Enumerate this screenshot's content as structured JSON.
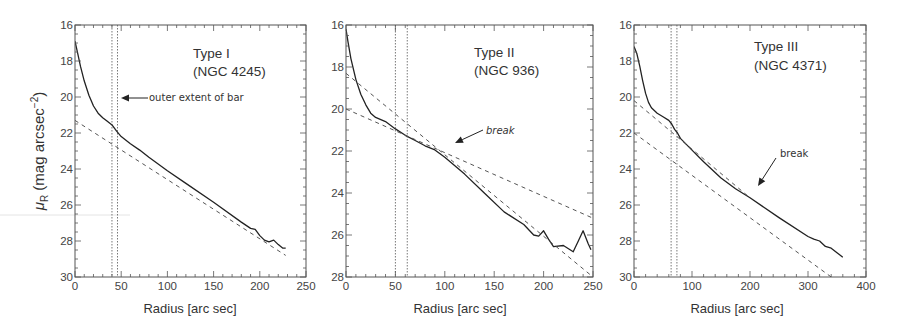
{
  "chart_data": [
    {
      "type": "line",
      "title": "Type I",
      "subtitle": "(NGC 4245)",
      "xlabel": "Radius [arc sec]",
      "ylabel": "μR (mag arcsec⁻²)",
      "xlim": [
        0,
        250
      ],
      "ylim": [
        30,
        16
      ],
      "xticks": [
        0,
        50,
        100,
        150,
        200,
        250
      ],
      "yticks": [
        16,
        18,
        20,
        22,
        24,
        26,
        28,
        30
      ],
      "bar_extent_lines": [
        40,
        46
      ],
      "annotations": [
        {
          "text": "outer extent of bar",
          "x": 46,
          "y": 20.1,
          "style": "normal"
        }
      ],
      "series": [
        {
          "name": "surface brightness profile",
          "style": "solid",
          "x": [
            0,
            3,
            6,
            10,
            15,
            20,
            25,
            30,
            35,
            40,
            45,
            50,
            60,
            70,
            80,
            100,
            120,
            150,
            180,
            190,
            195,
            200,
            205,
            210,
            215,
            220,
            225,
            228
          ],
          "y": [
            16.9,
            17.6,
            18.3,
            19.1,
            19.9,
            20.5,
            20.9,
            21.15,
            21.35,
            21.55,
            21.9,
            22.2,
            22.6,
            22.95,
            23.35,
            24.1,
            24.8,
            25.85,
            26.95,
            27.3,
            27.35,
            27.7,
            27.95,
            28.05,
            27.95,
            28.2,
            28.4,
            28.4
          ]
        },
        {
          "name": "exponential disk fit",
          "style": "dashed",
          "x": [
            0,
            228
          ],
          "y": [
            21.3,
            28.8
          ]
        }
      ]
    },
    {
      "type": "line",
      "title": "Type II",
      "subtitle": "(NGC 936)",
      "xlabel": "Radius [arc sec]",
      "ylabel": "",
      "xlim": [
        0,
        250
      ],
      "ylim": [
        28,
        16
      ],
      "xticks": [
        0,
        50,
        100,
        150,
        200,
        250
      ],
      "yticks": [
        16,
        18,
        20,
        22,
        24,
        26,
        28
      ],
      "bar_extent_lines": [
        50,
        62
      ],
      "annotations": [
        {
          "text": "break",
          "x": 100,
          "y": 22,
          "style": "italic"
        }
      ],
      "series": [
        {
          "name": "surface brightness profile",
          "style": "solid",
          "x": [
            0,
            2,
            5,
            10,
            15,
            20,
            25,
            30,
            40,
            50,
            60,
            70,
            80,
            90,
            100,
            120,
            140,
            160,
            180,
            190,
            195,
            200,
            205,
            210,
            220,
            230,
            235,
            240,
            245,
            248
          ],
          "y": [
            16.2,
            16.8,
            17.6,
            18.6,
            19.3,
            19.8,
            20.2,
            20.4,
            20.6,
            20.95,
            21.25,
            21.5,
            21.75,
            21.95,
            22.3,
            23.1,
            24.0,
            24.9,
            25.5,
            26.0,
            26.05,
            25.8,
            26.2,
            26.55,
            26.5,
            26.8,
            26.3,
            25.8,
            26.4,
            26.7
          ]
        },
        {
          "name": "inner disk fit",
          "style": "dashed",
          "x": [
            0,
            250
          ],
          "y": [
            20.0,
            25.2
          ]
        },
        {
          "name": "outer disk fit",
          "style": "dashed",
          "x": [
            0,
            250
          ],
          "y": [
            18.3,
            28.0
          ]
        }
      ]
    },
    {
      "type": "line",
      "title": "Type III",
      "subtitle": "(NGC 4371)",
      "xlabel": "Radius [arc sec]",
      "ylabel": "",
      "xlim": [
        0,
        400
      ],
      "ylim": [
        30,
        16
      ],
      "xticks": [
        0,
        100,
        200,
        300,
        400
      ],
      "yticks": [
        16,
        18,
        20,
        22,
        24,
        26,
        28,
        30
      ],
      "bar_extent_lines": [
        64,
        74
      ],
      "annotations": [
        {
          "text": "break",
          "x": 200,
          "y": 23.2,
          "style": "normal"
        }
      ],
      "series": [
        {
          "name": "surface brightness profile",
          "style": "solid",
          "x": [
            0,
            5,
            10,
            15,
            20,
            25,
            30,
            40,
            50,
            60,
            65,
            70,
            75,
            80,
            100,
            120,
            150,
            175,
            200,
            250,
            300,
            310,
            320,
            330,
            340,
            350,
            360
          ],
          "y": [
            17.2,
            17.6,
            18.3,
            19.1,
            19.8,
            20.3,
            20.6,
            20.9,
            21.1,
            21.3,
            21.5,
            21.8,
            22.0,
            22.3,
            22.95,
            23.6,
            24.5,
            25.1,
            25.6,
            26.7,
            27.75,
            27.9,
            28.0,
            28.3,
            28.4,
            28.65,
            28.9
          ]
        },
        {
          "name": "inner disk fit",
          "style": "dashed",
          "x": [
            0,
            200
          ],
          "y": [
            20.2,
            25.6
          ]
        },
        {
          "name": "outer disk fit",
          "style": "dashed",
          "x": [
            0,
            340
          ],
          "y": [
            22.0,
            30.0
          ]
        }
      ]
    }
  ],
  "panels": [
    {
      "title": "Type I",
      "subtitle": "(NGC 4245)",
      "annotation": "outer extent of bar",
      "xlabel": "Radius [arc sec]",
      "xtick_labels": [
        "0",
        "50",
        "100",
        "150",
        "200",
        "250"
      ],
      "ytick_labels": [
        "16",
        "18",
        "20",
        "22",
        "24",
        "26",
        "28",
        "30"
      ]
    },
    {
      "title": "Type II",
      "subtitle": "(NGC 936)",
      "annotation": "break",
      "xlabel": "Radius [arc sec]",
      "xtick_labels": [
        "0",
        "50",
        "100",
        "150",
        "200",
        "250"
      ],
      "ytick_labels": [
        "16",
        "18",
        "20",
        "22",
        "24",
        "26",
        "28"
      ]
    },
    {
      "title": "Type III",
      "subtitle": "(NGC 4371)",
      "annotation": "break",
      "xlabel": "Radius [arc sec]",
      "xtick_labels": [
        "0",
        "100",
        "200",
        "300",
        "400"
      ],
      "ytick_labels": [
        "16",
        "18",
        "20",
        "22",
        "24",
        "26",
        "28",
        "30"
      ]
    }
  ],
  "ylabel": {
    "main": "μ",
    "sub": "R",
    "rest": " (mag arcsec",
    "sup": "−2",
    "close": ")"
  }
}
